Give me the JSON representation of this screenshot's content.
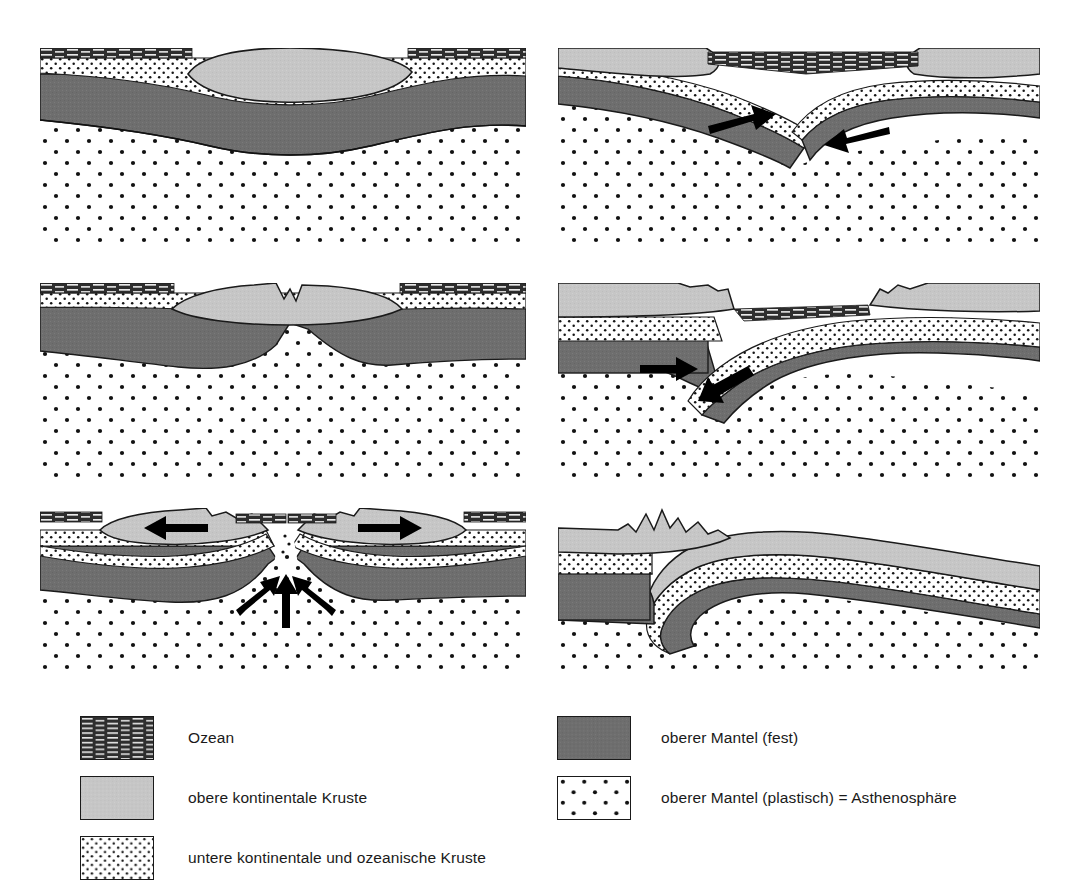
{
  "figure": {
    "panel_count": 6
  },
  "colors": {
    "upper_continental_crust": "#c6c6c6",
    "upper_mantle_solid": "#6e6e6e",
    "lower_crust": "#ffffff",
    "asthenosphere": "#ffffff",
    "ocean": "#3a3a3a",
    "outline": "#1a1a1a",
    "arrow": "#000000",
    "background": "#ffffff"
  },
  "panels": [
    {
      "id": "panel-1",
      "position": "top-left",
      "name": "continental-crust-thickening",
      "description": "Kontinentale Kruste mit verdicktem Krustenblock im Ozean",
      "has_arrows": false,
      "arrows": []
    },
    {
      "id": "panel-2",
      "position": "top-right",
      "name": "continent-continent-convergence",
      "description": "Zwei Platten bewegen sich aufeinander zu, beginnende Subduktion",
      "has_arrows": true,
      "arrows": [
        {
          "name": "arrow-right",
          "direction": "right"
        },
        {
          "name": "arrow-left",
          "direction": "left"
        }
      ]
    },
    {
      "id": "panel-3",
      "position": "middle-left",
      "name": "continental-rift-initiation",
      "description": "Beginnende Riftbildung mit aufsteigendem Mantel",
      "has_arrows": false,
      "arrows": []
    },
    {
      "id": "panel-4",
      "position": "middle-right",
      "name": "subduction-zone",
      "description": "Subduktion einer Platte unter die andere",
      "has_arrows": true,
      "arrows": [
        {
          "name": "arrow-right",
          "direction": "right"
        },
        {
          "name": "arrow-left-down",
          "direction": "left-down"
        }
      ]
    },
    {
      "id": "panel-5",
      "position": "bottom-left",
      "name": "seafloor-spreading",
      "description": "Auseinanderdriftende Kontinente mit Mantelaufstrom",
      "has_arrows": true,
      "arrows": [
        {
          "name": "arrow-left",
          "direction": "left"
        },
        {
          "name": "arrow-right",
          "direction": "right"
        },
        {
          "name": "arrow-up-center",
          "direction": "up"
        },
        {
          "name": "arrow-up-left",
          "direction": "up-right"
        },
        {
          "name": "arrow-up-right",
          "direction": "up-left"
        }
      ]
    },
    {
      "id": "panel-6",
      "position": "bottom-right",
      "name": "continental-collision-orogeny",
      "description": "Kontinentalkollision mit Gebirgsbildung",
      "has_arrows": false,
      "arrows": []
    }
  ],
  "legend": {
    "left_column": [
      {
        "key": "ozean",
        "label": "Ozean",
        "pattern": "horizontal-dashes-dark"
      },
      {
        "key": "obere-kruste",
        "label": "obere kontinentale Kruste",
        "pattern": "solid-light-gray"
      },
      {
        "key": "untere-kruste",
        "label": "untere kontinentale und ozeanische Kruste",
        "pattern": "fine-dense-dots"
      }
    ],
    "right_column": [
      {
        "key": "mantel-fest",
        "label": "oberer Mantel (fest)",
        "pattern": "solid-dark-gray"
      },
      {
        "key": "mantel-plastisch",
        "label": "oberer Mantel (plastisch) = Asthenosphäre",
        "pattern": "sparse-dots"
      }
    ]
  }
}
